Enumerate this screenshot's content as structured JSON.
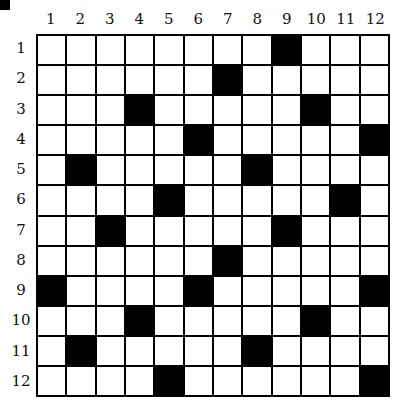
{
  "puzzle": {
    "columns": [
      "1",
      "2",
      "3",
      "4",
      "5",
      "6",
      "7",
      "8",
      "9",
      "10",
      "11",
      "12"
    ],
    "rows": [
      "1",
      "2",
      "3",
      "4",
      "5",
      "6",
      "7",
      "8",
      "9",
      "10",
      "11",
      "12"
    ],
    "black_cells": [
      [
        1,
        9
      ],
      [
        2,
        7
      ],
      [
        3,
        4
      ],
      [
        3,
        10
      ],
      [
        4,
        6
      ],
      [
        4,
        12
      ],
      [
        5,
        2
      ],
      [
        5,
        8
      ],
      [
        6,
        5
      ],
      [
        6,
        11
      ],
      [
        7,
        3
      ],
      [
        7,
        9
      ],
      [
        8,
        7
      ],
      [
        9,
        1
      ],
      [
        9,
        6
      ],
      [
        9,
        12
      ],
      [
        10,
        4
      ],
      [
        10,
        10
      ],
      [
        11,
        2
      ],
      [
        11,
        8
      ],
      [
        12,
        5
      ],
      [
        12,
        12
      ]
    ]
  }
}
